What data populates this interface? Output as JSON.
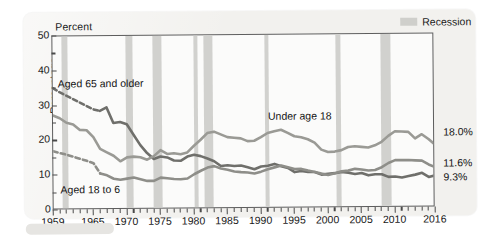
{
  "figure": {
    "percent_caption": "Percent",
    "ylabel": "Percentage",
    "legend": {
      "swatch_name": "recession-swatch",
      "label": "Recession"
    },
    "series_labels": {
      "aged65": "Aged 65 and older",
      "under18": "Under age 18",
      "aged1864": "Aged 18 to 6"
    },
    "end_values": {
      "under18": "18.0%",
      "aged1864": "11.6%",
      "aged65": "9.3%"
    },
    "colors": {
      "band": "#cfcfcb",
      "under18_line": "#9a9a95",
      "aged1864_line": "#8e8e89",
      "aged65_line": "#6f6f6b",
      "axis": "#5d5d5d",
      "panel": "#f2f1ee"
    }
  },
  "chart_data": {
    "type": "line",
    "title": "",
    "subtitle": "",
    "xlabel": "",
    "ylabel": "Percentage",
    "ylim": [
      0,
      50
    ],
    "xlim": [
      1959,
      2016
    ],
    "yticks": [
      0,
      10,
      20,
      30,
      40,
      50
    ],
    "yticks_minor": [
      5,
      15,
      25,
      35,
      45
    ],
    "xticks": [
      1959,
      1965,
      1970,
      1975,
      1980,
      1985,
      1990,
      1995,
      2000,
      2005,
      2010,
      2016
    ],
    "grid": false,
    "legend_position": "top-right",
    "legend_entries": [
      "Recession"
    ],
    "annotations": [
      {
        "text": "Percent",
        "position": "top-left-outside"
      },
      {
        "text": "Aged 65 and older",
        "x": 1962,
        "y": 38
      },
      {
        "text": "Under age 18",
        "x": 1991,
        "y": 26
      },
      {
        "text": "Aged 18 to 6",
        "x": 1962,
        "y": 5
      },
      {
        "text": "18.0%",
        "x": 2017,
        "y": 18.0
      },
      {
        "text": "11.6%",
        "x": 2017,
        "y": 11.6
      },
      {
        "text": "9.3%",
        "x": 2017,
        "y": 9.3
      }
    ],
    "x": [
      1959,
      1960,
      1961,
      1962,
      1963,
      1964,
      1965,
      1966,
      1967,
      1968,
      1969,
      1970,
      1971,
      1972,
      1973,
      1974,
      1975,
      1976,
      1977,
      1978,
      1979,
      1980,
      1981,
      1982,
      1983,
      1984,
      1985,
      1986,
      1987,
      1988,
      1989,
      1990,
      1991,
      1992,
      1993,
      1994,
      1995,
      1996,
      1997,
      1998,
      1999,
      2000,
      2001,
      2002,
      2003,
      2004,
      2005,
      2006,
      2007,
      2008,
      2009,
      2010,
      2011,
      2012,
      2013,
      2014,
      2015,
      2016
    ],
    "series": [
      {
        "name": "Aged 65 and older",
        "color": "#6f6f6b",
        "dashed_until": 1966,
        "end_label": "9.3%",
        "values": [
          35.2,
          34.0,
          33.0,
          32.0,
          31.0,
          30.0,
          29.0,
          28.5,
          29.5,
          25.0,
          25.3,
          24.6,
          21.6,
          18.6,
          16.3,
          14.6,
          15.3,
          15.0,
          14.1,
          14.0,
          15.2,
          15.7,
          15.3,
          14.6,
          13.8,
          12.4,
          12.6,
          12.4,
          12.5,
          12.0,
          11.4,
          12.2,
          12.4,
          12.9,
          12.2,
          11.7,
          10.5,
          10.8,
          10.5,
          10.5,
          9.7,
          9.9,
          10.1,
          10.4,
          10.2,
          9.8,
          10.1,
          9.4,
          9.7,
          9.7,
          8.9,
          9.0,
          8.7,
          9.1,
          9.5,
          10.0,
          8.8,
          9.3
        ]
      },
      {
        "name": "Under age 18",
        "color": "#9a9a95",
        "dashed_until": null,
        "end_label": "18.0%",
        "values": [
          27.3,
          26.5,
          25.2,
          24.7,
          23.1,
          23.0,
          21.0,
          17.6,
          16.6,
          15.6,
          14.0,
          15.1,
          15.3,
          15.1,
          14.4,
          15.4,
          17.1,
          16.0,
          16.2,
          15.9,
          16.4,
          18.3,
          20.0,
          21.9,
          22.3,
          21.5,
          20.7,
          20.5,
          20.3,
          19.5,
          19.6,
          20.6,
          21.8,
          22.3,
          22.7,
          21.8,
          20.8,
          20.5,
          19.9,
          18.9,
          16.9,
          16.2,
          16.3,
          16.7,
          17.6,
          17.8,
          17.6,
          17.4,
          18.0,
          19.0,
          20.7,
          22.0,
          21.9,
          21.8,
          19.9,
          21.1,
          19.7,
          18.0
        ]
      },
      {
        "name": "Aged 18 to 64",
        "color": "#8e8e89",
        "dashed_until": 1966,
        "end_label": "11.6%",
        "values": [
          17.0,
          16.5,
          16.0,
          15.4,
          14.8,
          14.2,
          13.5,
          10.5,
          10.0,
          9.0,
          8.7,
          9.0,
          9.3,
          8.8,
          8.3,
          8.3,
          9.2,
          9.0,
          8.8,
          8.7,
          8.9,
          10.1,
          11.1,
          12.0,
          12.4,
          11.7,
          11.3,
          10.8,
          10.6,
          10.5,
          10.2,
          10.7,
          11.4,
          11.9,
          12.4,
          11.9,
          11.4,
          11.4,
          10.9,
          10.5,
          10.0,
          9.6,
          10.1,
          10.6,
          10.8,
          11.3,
          11.1,
          10.8,
          10.9,
          11.7,
          12.9,
          13.7,
          13.7,
          13.7,
          13.6,
          13.5,
          12.4,
          11.6
        ]
      }
    ],
    "recession_bands": [
      {
        "start": 1960.3,
        "end": 1961.2
      },
      {
        "start": 1969.9,
        "end": 1970.9
      },
      {
        "start": 1973.9,
        "end": 1975.2
      },
      {
        "start": 1980.0,
        "end": 1980.6
      },
      {
        "start": 1981.5,
        "end": 1982.9
      },
      {
        "start": 1990.6,
        "end": 1991.2
      },
      {
        "start": 2001.2,
        "end": 2001.9
      },
      {
        "start": 2007.9,
        "end": 2009.5
      }
    ]
  }
}
